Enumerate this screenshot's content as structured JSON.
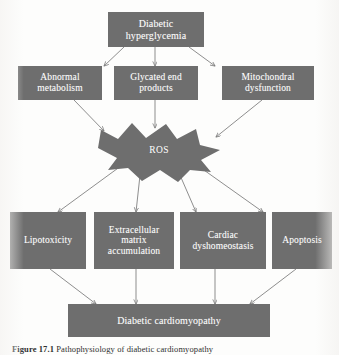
{
  "figure": {
    "box_color": "#6e6e6e",
    "text_color": "#ffffff",
    "arrow_color": "#7a7a7a",
    "background": "#fdfdfc"
  },
  "nodes": {
    "root": {
      "label": "Diabetic\nhyperglycemia",
      "line1": "Diabetic",
      "line2": "hyperglycemia"
    },
    "mechanisms": [
      {
        "name": "abnormal-metabolism",
        "line1": "Abnormal",
        "line2": "metabolism",
        "line3": ""
      },
      {
        "name": "glycated-end-products",
        "line1": "Glycated end",
        "line2": "products",
        "line3": ""
      },
      {
        "name": "mitochondral-dysfunction",
        "line1": "Mitochondral",
        "line2": "dysfunction",
        "line3": ""
      }
    ],
    "hub": {
      "name": "ros",
      "label": "ROS",
      "shape": "starburst"
    },
    "effects": [
      {
        "name": "lipotoxicity",
        "line1": "Lipotoxicity",
        "line2": "",
        "line3": ""
      },
      {
        "name": "extracellular-matrix-accumulation",
        "line1": "Extracellular",
        "line2": "matrix",
        "line3": "accumulation"
      },
      {
        "name": "cardiac-dyshomeostasis",
        "line1": "Cardiac",
        "line2": "dyshomeostasis",
        "line3": ""
      },
      {
        "name": "apoptosis",
        "line1": "Apoptosis",
        "line2": "",
        "line3": ""
      }
    ],
    "outcome": {
      "name": "diabetic-cardiomyopathy",
      "label": "Diabetic cardiomyopathy"
    }
  },
  "caption": {
    "number": "Figure 17.1",
    "text": "Pathophysiology of diabetic cardiomyopathy"
  }
}
